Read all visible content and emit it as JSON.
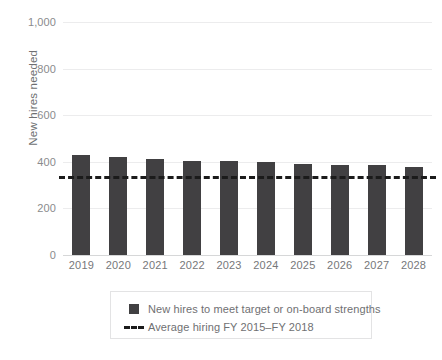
{
  "chart_data": {
    "type": "bar",
    "title": "",
    "subtitle": "",
    "xlabel": "",
    "ylabel": "New hires needed",
    "ylim": [
      0,
      1000
    ],
    "yticks": [
      0,
      200,
      400,
      600,
      800,
      1000
    ],
    "ytick_labels": [
      "0",
      "200",
      "400",
      "600",
      "800",
      "1,000"
    ],
    "grid": true,
    "legend_position": "bottom",
    "categories": [
      "2019",
      "2020",
      "2021",
      "2022",
      "2023",
      "2024",
      "2025",
      "2026",
      "2027",
      "2028"
    ],
    "series": [
      {
        "name": "New hires to meet target or on-board strengths",
        "type": "bar",
        "color": "#414042",
        "values": [
          430,
          420,
          412,
          404,
          404,
          400,
          391,
          387,
          387,
          378
        ]
      },
      {
        "name": "Average hiring FY 2015–FY 2018",
        "type": "hline",
        "color": "#1b1b1b",
        "style": "dashed",
        "value": 340
      }
    ],
    "legend": [
      {
        "marker": "square",
        "label": "New hires to meet target or on-board strengths",
        "color": "#414042"
      },
      {
        "marker": "dashed-line",
        "label": "Average hiring FY 2015–FY 2018",
        "color": "#1b1b1b"
      }
    ]
  },
  "colors": {
    "bar": "#414042",
    "average_line": "#1b1b1b",
    "gridline": "#ececed",
    "axis": "#d6d7d8",
    "text": "#6f7072",
    "background": "#ffffff"
  }
}
